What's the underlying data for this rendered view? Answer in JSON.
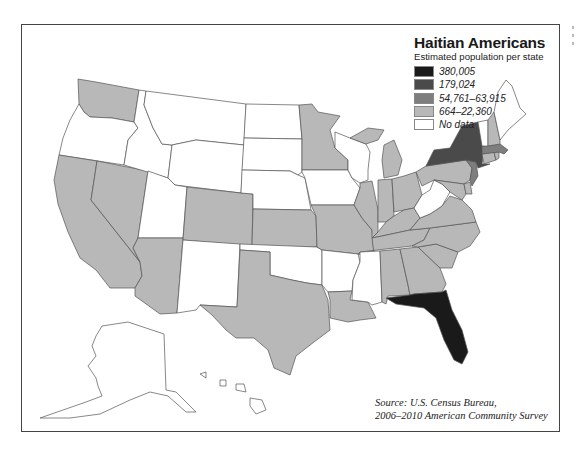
{
  "title": "Haitian Americans",
  "subtitle": "Estimated population per state",
  "legend": [
    {
      "label": "380,005",
      "color": "#1a1a1a"
    },
    {
      "label": "179,024",
      "color": "#4a4a4a"
    },
    {
      "label": "54,761–63,915",
      "color": "#7e7e7e"
    },
    {
      "label": "664–22,360",
      "color": "#b8b8b8"
    },
    {
      "label": "No data",
      "color": "#ffffff"
    }
  ],
  "source": {
    "prefix": "Source:",
    "line1": " U.S. Census Bureau,",
    "line2": "2006–2010 American Community Survey"
  },
  "colors": {
    "black": "#1a1a1a",
    "dark": "#4a4a4a",
    "medium": "#7e7e7e",
    "light": "#b8b8b8",
    "nodata": "#ffffff"
  },
  "states": {
    "Florida": "380,005",
    "New York": "179,024",
    "Massachusetts": "54,761–63,915",
    "New Jersey": "54,761–63,915",
    "Washington": "664–22,360",
    "California": "664–22,360",
    "Nevada": "664–22,360",
    "Arizona": "664–22,360",
    "Colorado": "664–22,360",
    "Kansas": "664–22,360",
    "Texas": "664–22,360",
    "Minnesota": "664–22,360",
    "Missouri": "664–22,360",
    "Louisiana": "664–22,360",
    "Illinois": "664–22,360",
    "Michigan": "664–22,360",
    "Indiana": "664–22,360",
    "Ohio": "664–22,360",
    "Kentucky": "664–22,360",
    "Tennessee": "664–22,360",
    "Alabama": "664–22,360",
    "Georgia": "664–22,360",
    "South Carolina": "664–22,360",
    "North Carolina": "664–22,360",
    "Virginia": "664–22,360",
    "Pennsylvania": "664–22,360",
    "Maryland": "664–22,360",
    "Delaware": "664–22,360",
    "Connecticut": "664–22,360",
    "Rhode Island": "664–22,360",
    "New Hampshire": "664–22,360",
    "Oregon": "No data",
    "Idaho": "No data",
    "Montana": "No data",
    "Wyoming": "No data",
    "Utah": "No data",
    "New Mexico": "No data",
    "North Dakota": "No data",
    "South Dakota": "No data",
    "Nebraska": "No data",
    "Oklahoma": "No data",
    "Iowa": "No data",
    "Wisconsin": "No data",
    "Arkansas": "No data",
    "Mississippi": "No data",
    "West Virginia": "No data",
    "Vermont": "No data",
    "Maine": "No data",
    "Alaska": "No data",
    "Hawaii": "No data"
  }
}
